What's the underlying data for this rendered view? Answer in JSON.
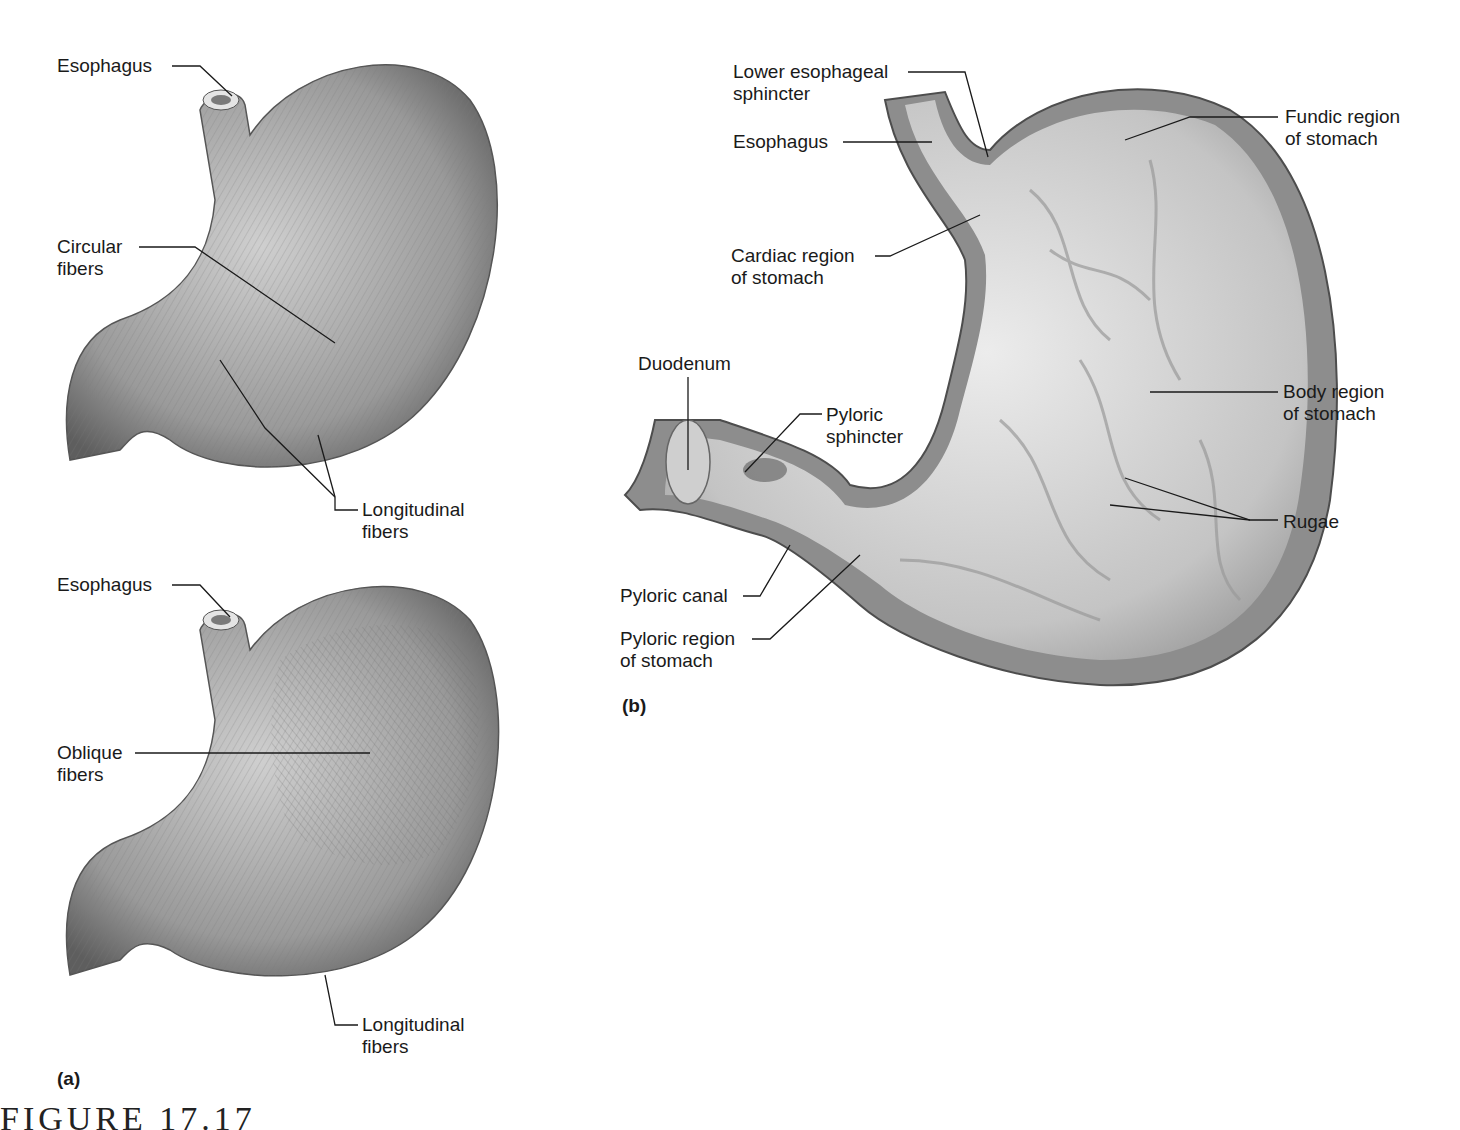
{
  "figure": {
    "caption": "FIGURE 17.17",
    "panels": {
      "a": "(a)",
      "b": "(b)"
    }
  },
  "panel_a_top": {
    "labels": [
      {
        "text": "Esophagus",
        "x": 57,
        "y": 55
      },
      {
        "text": "Circular\nfibers",
        "x": 57,
        "y": 236
      },
      {
        "text": "Longitudinal\nfibers",
        "x": 362,
        "y": 499
      }
    ]
  },
  "panel_a_bottom": {
    "labels": [
      {
        "text": "Esophagus",
        "x": 57,
        "y": 574
      },
      {
        "text": "Oblique\nfibers",
        "x": 57,
        "y": 742
      },
      {
        "text": "Longitudinal\nfibers",
        "x": 362,
        "y": 1014
      }
    ]
  },
  "panel_b": {
    "labels": [
      {
        "text": "Lower esophageal\nsphincter",
        "x": 733,
        "y": 61
      },
      {
        "text": "Esophagus",
        "x": 733,
        "y": 131
      },
      {
        "text": "Fundic region\nof stomach",
        "x": 1285,
        "y": 106
      },
      {
        "text": "Cardiac region\nof stomach",
        "x": 731,
        "y": 245
      },
      {
        "text": "Duodenum",
        "x": 638,
        "y": 353
      },
      {
        "text": "Pyloric\nsphincter",
        "x": 826,
        "y": 404
      },
      {
        "text": "Body region\nof stomach",
        "x": 1283,
        "y": 381
      },
      {
        "text": "Rugae",
        "x": 1283,
        "y": 511
      },
      {
        "text": "Pyloric canal",
        "x": 620,
        "y": 585
      },
      {
        "text": "Pyloric region\nof stomach",
        "x": 620,
        "y": 628
      }
    ]
  },
  "colors": {
    "tissue_light": "#d9d9d9",
    "tissue_mid": "#a8a8a8",
    "tissue_dark": "#6e6e6e",
    "leader": "#1a1a1a"
  }
}
